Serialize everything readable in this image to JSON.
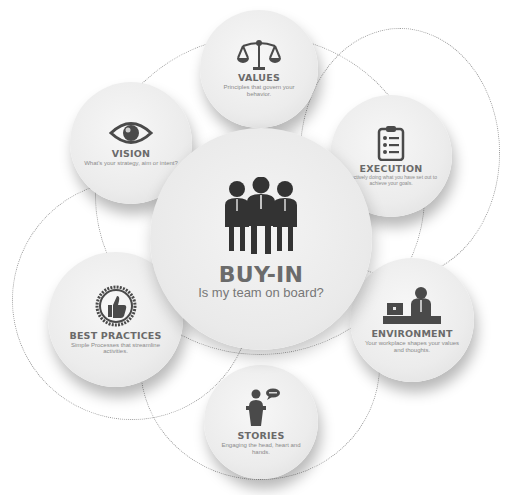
{
  "diagram": {
    "type": "hub-and-spoke",
    "center": {
      "title": "BUY-IN",
      "subtitle": "Is my team on board?",
      "icon": "team-icon"
    },
    "nodes": [
      {
        "id": "values",
        "title": "VALUES",
        "desc": "Principles that govern your behavior.",
        "icon": "scales-icon"
      },
      {
        "id": "vision",
        "title": "VISION",
        "desc": "What's your strategy, aim or intent?",
        "icon": "eye-icon"
      },
      {
        "id": "execution",
        "title": "EXECUTION",
        "desc": "Effectively doing what you have set out to achieve your goals.",
        "icon": "clipboard-checklist-icon"
      },
      {
        "id": "best_practices",
        "title": "BEST PRACTICES",
        "desc": "Simple Processes that streamline activities.",
        "icon": "thumbs-up-badge-icon"
      },
      {
        "id": "environment",
        "title": "ENVIRONMENT",
        "desc": "Your workplace shapes your values and thoughts.",
        "icon": "office-desk-icon"
      },
      {
        "id": "stories",
        "title": "STORIES",
        "desc": "Engaging the head, heart and hands.",
        "icon": "speaker-podium-icon"
      }
    ],
    "colors": {
      "icon": "#4a4a4a",
      "title": "#6a6a6a",
      "desc": "#8a8a8a",
      "circle": "#ececec",
      "dashed": "#9a9a9a"
    }
  }
}
